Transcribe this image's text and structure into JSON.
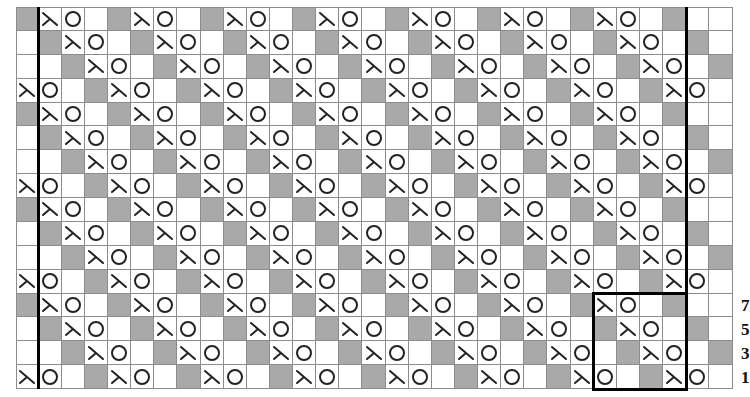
{
  "chart": {
    "columns": 31,
    "rows": 16,
    "cell_width": 23.13,
    "cell_height": 23.875,
    "legend_symbols": {
      "G": "gray-no-stitch",
      "L": "left-decrease-lambda",
      "O": "yarn-over-circle",
      ".": "blank-knit"
    },
    "colors": {
      "gray": "#a9a9a9",
      "grid_line": "#8c8c8c",
      "thick_line": "#000000",
      "symbol": "#222222"
    },
    "grid_rows": [
      "GLO.GLO.GLO.GLO.GLO.GLO.GLO.G..",
      ".GLO.GLO.GLO.GLO.GLO.GLO.GLO.G.",
      "..GLO.GLO.GLO.GLO.GLO.GLO.GLO.G",
      "LO.GLO.GLO.GLO.GLO.GLO.GLO.GLO.",
      "GLO.GLO.GLO.GLO.GLO.GLO.GLO.G..",
      ".GLO.GLO.GLO.GLO.GLO.GLO.GLO.G.",
      "..GLO.GLO.GLO.GLO.GLO.GLO.GLO.G",
      "LO.GLO.GLO.GLO.GLO.GLO.GLO.GLO.",
      "GLO.GLO.GLO.GLO.GLO.GLO.GLO.G..",
      ".GLO.GLO.GLO.GLO.GLO.GLO.GLO.G.",
      "..GLO.GLO.GLO.GLO.GLO.GLO.GLO.G",
      "LO.GLO.GLO.GLO.GLO.GLO.GLO.GLO.",
      "GLO.GLO.GLO.GLO.GLO.GLO.GLO.G..",
      ".GLO.GLO.GLO.GLO.GLO.GLO.GLO.G.",
      "..GLO.GLO.GLO.GLO.GLO.GLO.GLO.G",
      "LO.GLO.GLO.GLO.GLO.GLO.GLO.GLO."
    ],
    "thick_vertical_lines_after_column": [
      0,
      28
    ],
    "repeat_box": {
      "col_start": 25,
      "col_end": 28,
      "row_start": 12,
      "row_end": 15
    },
    "row_labels": [
      {
        "row": 12,
        "text": "7"
      },
      {
        "row": 13,
        "text": "5"
      },
      {
        "row": 14,
        "text": "3"
      },
      {
        "row": 15,
        "text": "1"
      }
    ]
  }
}
